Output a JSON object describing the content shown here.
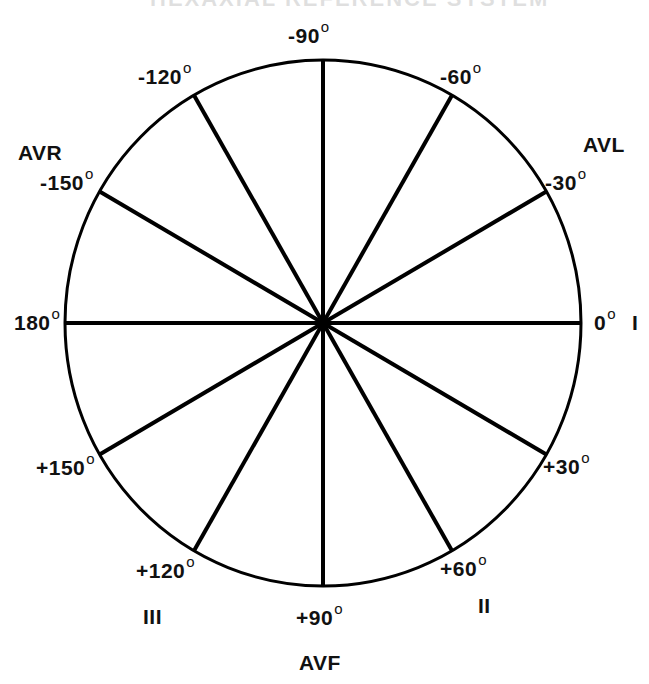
{
  "diagram": {
    "title": "HEXAXIAL REFERENCE SYSTEM",
    "title_visible": "cropped",
    "type": "hexaxial-reference-system",
    "colors": {
      "background": "#ffffff",
      "stroke": "#000000",
      "text": "#111111"
    },
    "circle": {
      "cx": 323,
      "cy": 323,
      "rx": 258,
      "ry": 263,
      "stroke_width": 3
    },
    "spoke_stroke_width": 4,
    "center_dot_radius": 7,
    "spokes": [
      {
        "angle_deg": 0
      },
      {
        "angle_deg": 30
      },
      {
        "angle_deg": 60
      },
      {
        "angle_deg": 90
      },
      {
        "angle_deg": 120
      },
      {
        "angle_deg": 150
      },
      {
        "angle_deg": 180
      },
      {
        "angle_deg": -150
      },
      {
        "angle_deg": -120
      },
      {
        "angle_deg": -90
      },
      {
        "angle_deg": -60
      },
      {
        "angle_deg": -30
      }
    ],
    "angle_labels": [
      {
        "id": "neg90",
        "text": "-90",
        "deg": "o",
        "x": 288,
        "y": 25
      },
      {
        "id": "neg60",
        "text": "-60",
        "deg": "o",
        "x": 440,
        "y": 66
      },
      {
        "id": "neg120",
        "text": "-120",
        "deg": "o",
        "x": 138,
        "y": 66
      },
      {
        "id": "neg30",
        "text": "-30",
        "deg": "o",
        "x": 545,
        "y": 172
      },
      {
        "id": "neg150",
        "text": "-150",
        "deg": "o",
        "x": 40,
        "y": 172
      },
      {
        "id": "zero",
        "text": "0",
        "deg": "o",
        "x": 594,
        "y": 312
      },
      {
        "id": "180",
        "text": "180",
        "deg": "o",
        "x": 14,
        "y": 312
      },
      {
        "id": "pos30",
        "text": "+30",
        "deg": "o",
        "x": 543,
        "y": 456
      },
      {
        "id": "pos150",
        "text": "+150",
        "deg": "o",
        "x": 36,
        "y": 457
      },
      {
        "id": "pos60",
        "text": "+60",
        "deg": "o",
        "x": 440,
        "y": 558
      },
      {
        "id": "pos120",
        "text": "+120",
        "deg": "o",
        "x": 136,
        "y": 560
      },
      {
        "id": "pos90",
        "text": "+90",
        "deg": "o",
        "x": 296,
        "y": 607
      }
    ],
    "lead_labels": [
      {
        "id": "lead-avr",
        "text": "AVR",
        "x": 18,
        "y": 142
      },
      {
        "id": "lead-avl",
        "text": "AVL",
        "x": 583,
        "y": 134
      },
      {
        "id": "lead-i",
        "text": "I",
        "x": 632,
        "y": 312
      },
      {
        "id": "lead-ii",
        "text": "II",
        "x": 478,
        "y": 595
      },
      {
        "id": "lead-iii",
        "text": "III",
        "x": 143,
        "y": 606
      },
      {
        "id": "lead-avf",
        "text": "AVF",
        "x": 299,
        "y": 652
      }
    ]
  }
}
